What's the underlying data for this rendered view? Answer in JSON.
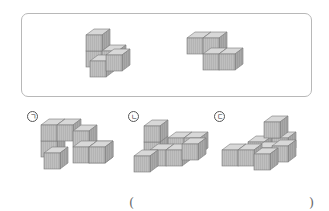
{
  "question_box": {
    "shapes": [
      {
        "name": "reference-piece-1",
        "cubes": 4
      },
      {
        "name": "reference-piece-2",
        "cubes": 4
      }
    ]
  },
  "options": [
    {
      "label": "ㄱ",
      "cubes": 8
    },
    {
      "label": "ㄴ",
      "cubes": 8
    },
    {
      "label": "ㄷ",
      "cubes": 8
    }
  ],
  "answer": {
    "open_paren": "(",
    "close_paren": ")",
    "value": ""
  },
  "colors": {
    "top": "#d6d6d6",
    "front": "#bdbdbd",
    "side": "#a6a6a6",
    "edge": "#7a7a7a",
    "frame": "#b8b8b8"
  }
}
